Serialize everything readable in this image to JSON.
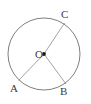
{
  "figure": {
    "kind": "circle-with-three-radii",
    "background_color": "#ffffff",
    "stroke_color": "#6f6f6f",
    "label_color": "#3b3b3b",
    "center_dot_color": "#1a1a1a",
    "circle": {
      "center_x": 44,
      "center_y": 54,
      "radius": 36,
      "stroke_width": 0.9
    },
    "center_point": {
      "label": "O",
      "x": 44,
      "y": 54,
      "dot_radius": 1.9
    },
    "points": [
      {
        "label": "A",
        "x": 18.5,
        "y": 80.5,
        "angle_deg": 225
      },
      {
        "label": "B",
        "x": 66.0,
        "y": 84.0,
        "angle_deg": 304
      },
      {
        "label": "C",
        "x": 64.5,
        "y": 23.0,
        "angle_deg": 60
      }
    ],
    "segments": [
      {
        "name": "radius-OA",
        "from": "O",
        "to": "A"
      },
      {
        "name": "radius-OB",
        "from": "O",
        "to": "B"
      },
      {
        "name": "radius-OC",
        "from": "O",
        "to": "C"
      }
    ],
    "labels": {
      "center": "O",
      "point_a": "A",
      "point_b": "B",
      "point_c": "C"
    }
  }
}
